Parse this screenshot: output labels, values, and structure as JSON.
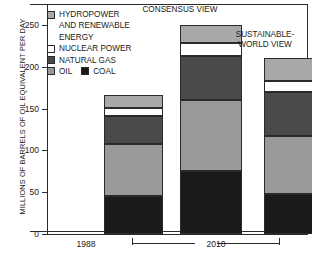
{
  "chart_data": {
    "type": "bar",
    "subtype": "stacked",
    "title": "",
    "xlabel": "",
    "ylabel": "MILLIONS OF BARRELS OF OIL EQUIVALENT PER DAY",
    "ylim": [
      0,
      260
    ],
    "yticks": [
      0,
      50,
      100,
      150,
      200,
      250
    ],
    "grid": false,
    "legend_position": "top-left",
    "categories": [
      "1988",
      "2010 CONSENSUS VIEW",
      "2010 SUSTAINABLE-WORLD VIEW"
    ],
    "series": [
      {
        "name": "COAL",
        "color": "#1a1a1a",
        "values": [
          45,
          75,
          48
        ]
      },
      {
        "name": "OIL",
        "color": "#999999",
        "values": [
          63,
          85,
          69
        ]
      },
      {
        "name": "NATURAL GAS",
        "color": "#4a4a4a",
        "values": [
          33,
          53,
          53
        ]
      },
      {
        "name": "NUCLEAR POWER",
        "color": "#ffffff",
        "values": [
          10,
          15,
          13
        ]
      },
      {
        "name": "HYDROPOWER AND RENEWABLE ENERGY",
        "color": "#a8a8a8",
        "values": [
          15,
          22,
          27
        ]
      }
    ],
    "totals": [
      166,
      250,
      210
    ],
    "bar_titles": [
      "",
      "CONSENSUS VIEW",
      "SUSTAINABLE-\nWORLD VIEW"
    ],
    "group_bracket_label": "2010",
    "standalone_label": "1988"
  },
  "legend": {
    "items": [
      {
        "label": "HYDROPOWER",
        "label_cont": [
          "AND RENEWABLE",
          "ENERGY"
        ],
        "color": "#a8a8a8"
      },
      {
        "label": "NUCLEAR POWER",
        "color": "#ffffff"
      },
      {
        "label": "NATURAL GAS",
        "color": "#4a4a4a"
      },
      {
        "label": "OIL",
        "color": "#999999"
      },
      {
        "label": "COAL",
        "color": "#1a1a1a"
      }
    ]
  },
  "axis": {
    "y_title": "MILLIONS OF BARRELS OF OIL EQUIVALENT PER DAY",
    "ticks": [
      "250",
      "200",
      "150",
      "100",
      "50",
      "0"
    ]
  }
}
